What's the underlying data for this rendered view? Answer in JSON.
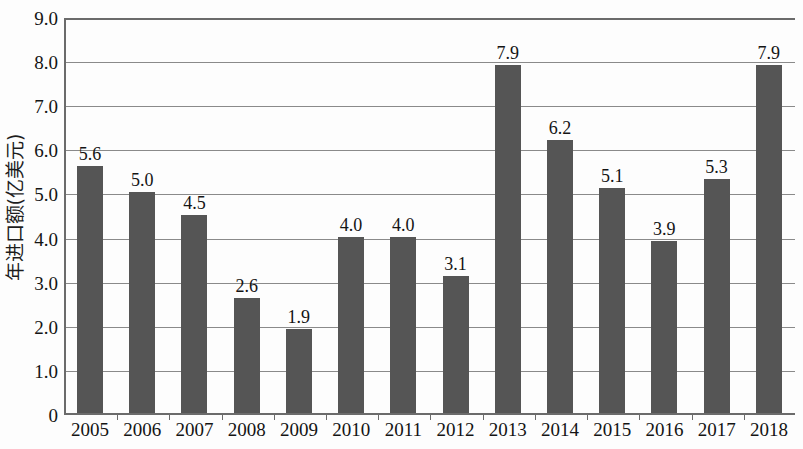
{
  "chart_data": {
    "type": "bar",
    "title": "",
    "subtitle": "",
    "xlabel": "",
    "ylabel": "年进口额(亿美元)",
    "categories": [
      "2005",
      "2006",
      "2007",
      "2008",
      "2009",
      "2010",
      "2011",
      "2012",
      "2013",
      "2014",
      "2015",
      "2016",
      "2017",
      "2018"
    ],
    "values": [
      5.6,
      5.0,
      4.5,
      2.6,
      1.9,
      4.0,
      4.0,
      3.1,
      7.9,
      6.2,
      5.1,
      3.9,
      5.3,
      7.9
    ],
    "value_labels": [
      "5.6",
      "5.0",
      "4.5",
      "2.6",
      "1.9",
      "4.0",
      "4.0",
      "3.1",
      "7.9",
      "6.2",
      "5.1",
      "3.9",
      "5.3",
      "7.9"
    ],
    "ylim": [
      0,
      9
    ],
    "ytick_values": [
      0,
      1,
      2,
      3,
      4,
      5,
      6,
      7,
      8,
      9
    ],
    "ytick_labels": [
      "0",
      "1.0",
      "2.0",
      "3.0",
      "4.0",
      "5.0",
      "6.0",
      "7.0",
      "8.0",
      "9.0"
    ],
    "grid": true,
    "grid_axis": "y",
    "legend": false,
    "legend_position": "none",
    "bar_color": "#555555",
    "gridline_color": "#8a8a8a",
    "axis_color": "#6b6b6b",
    "background_color": "#fdfdfd",
    "data_labels_shown": true
  }
}
